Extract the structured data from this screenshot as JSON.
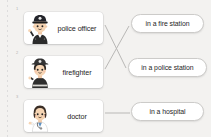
{
  "worksheet": {
    "type": "matching-exercise",
    "background_color": "#f3f2f0",
    "card_color": "#ffffff",
    "line_color": "#b9b8b6",
    "text_color": "#1e1e1e"
  },
  "rows": [
    {
      "number": "1",
      "term": "police officer",
      "avatar_icon": "police-officer-avatar-icon",
      "definition": "in a fire station"
    },
    {
      "number": "2",
      "term": "firefighter",
      "avatar_icon": "firefighter-avatar-icon",
      "definition": "in a police station"
    },
    {
      "number": "3",
      "term": "doctor",
      "avatar_icon": "doctor-avatar-icon",
      "definition": "in a hospital"
    }
  ],
  "connections": [
    {
      "from_row": 1,
      "to_row": 2,
      "label": "police officer to in a police station"
    },
    {
      "from_row": 2,
      "to_row": 1,
      "label": "firefighter to in a fire station"
    },
    {
      "from_row": 3,
      "to_row": 3,
      "label": "doctor to in a hospital"
    }
  ]
}
